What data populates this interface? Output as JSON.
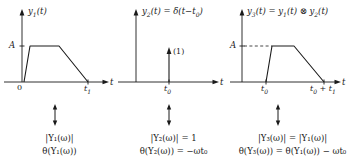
{
  "figure": {
    "type": "signal-convolution-diagram",
    "columns": [
      {
        "id": "column-1",
        "plot": {
          "signal_label": "y",
          "signal_sub": "1",
          "signal_arg": "(t)",
          "title_full": "y₁(t)",
          "yaxis_tick_label": "A",
          "origin_label": "0",
          "xaxis_label": "t",
          "xticks": [
            "t₁"
          ],
          "xtick_subs": [
            "1"
          ],
          "xtick_bases": [
            "t"
          ],
          "shape": "trapezoid",
          "breakpoints_t": [
            0,
            0.12,
            0.55,
            1.0
          ],
          "breakpoints_y": [
            0,
            1.0,
            1.0,
            0
          ],
          "amplitude": "A",
          "dashed_guide": false
        },
        "connector": "double-arrow-vertical",
        "magnitude_eq": "|Y₁(ω)|",
        "phase_eq": "θ(Y₁(ω))"
      },
      {
        "id": "column-2",
        "plot": {
          "signal_label": "y",
          "signal_sub": "2",
          "signal_arg": "(t)",
          "title_full": "y₂(t) = δ(t−t₀)",
          "yaxis_tick_label": "",
          "origin_label": "",
          "xaxis_label": "t",
          "xticks": [
            "t₀"
          ],
          "xtick_subs": [
            "0"
          ],
          "xtick_bases": [
            "t"
          ],
          "shape": "impulse",
          "impulse_at": "t₀",
          "impulse_weight_label": "(1)",
          "dashed_guide": false
        },
        "connector": "double-arrow-vertical",
        "magnitude_eq": "|Y₂(ω)| = 1",
        "phase_eq": "θ(Y₂(ω)) = −ωt₀"
      },
      {
        "id": "column-3",
        "plot": {
          "signal_label": "y",
          "signal_sub": "3",
          "signal_arg": "(t)",
          "title_full": "y₃(t) = y₁(t) ⊗ y₂(t)",
          "yaxis_tick_label": "A",
          "origin_label": "",
          "xaxis_label": "t",
          "xticks": [
            "t₀",
            "t₀ + t₁"
          ],
          "xtick_subs": [
            "0",
            "0,1"
          ],
          "xtick_bases": [
            "t",
            "t"
          ],
          "shape": "trapezoid-shifted",
          "breakpoints_t": [
            0.3,
            0.42,
            0.62,
            1.0
          ],
          "breakpoints_y": [
            0,
            1.0,
            1.0,
            0
          ],
          "amplitude": "A",
          "dashed_guide": true
        },
        "connector": "double-arrow-vertical",
        "magnitude_eq": "|Y₃(ω)| = |Y₁(ω)|",
        "phase_eq": "θ(Y₃(ω)) = θ(Y₁(ω)) − ωt₀"
      }
    ],
    "colors": {
      "ink": "#1a1a1a",
      "background": "#ffffff",
      "dashed": "#1a1a1a"
    }
  }
}
